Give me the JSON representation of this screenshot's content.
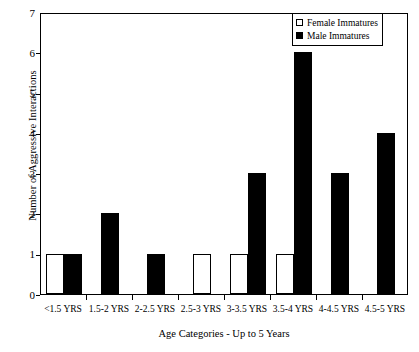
{
  "chart_data": {
    "type": "bar",
    "title": "",
    "xlabel": "Age Categories - Up to 5 Years",
    "ylabel": "Number of Aggressive Interactions",
    "categories": [
      "<1.5 YRS",
      "1.5-2 YRS",
      "2-2.5 YRS",
      "2.5-3 YRS",
      "3-3.5 YRS",
      "3.5-4 YRS",
      "4-4.5 YRS",
      "4.5-5 YRS"
    ],
    "series": [
      {
        "name": "Female Immatures",
        "color": "#ffffff",
        "values": [
          1,
          0,
          0,
          1,
          1,
          1,
          0,
          0
        ]
      },
      {
        "name": "Male Immatures",
        "color": "#000000",
        "values": [
          1,
          2,
          1,
          0,
          3,
          6,
          3,
          4
        ]
      }
    ],
    "ylim": [
      0,
      7
    ],
    "yticks": [
      0,
      1,
      2,
      3,
      4,
      5,
      6,
      7
    ],
    "ytick_labels": [
      "0",
      "1",
      "2",
      "3",
      "4",
      "5",
      "6",
      "7"
    ],
    "grid": false,
    "legend_position": "top-right",
    "frame": true
  },
  "legend": {
    "items": [
      {
        "label": "Female Immatures",
        "swatch": "female"
      },
      {
        "label": "Male Immatures",
        "swatch": "male"
      }
    ]
  }
}
